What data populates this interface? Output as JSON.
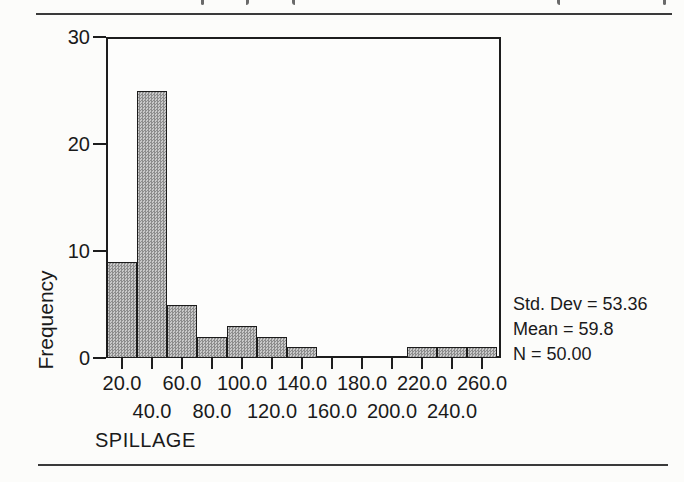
{
  "chart_data": {
    "type": "bar",
    "subtype": "histogram",
    "categories": [
      "20.0",
      "40.0",
      "60.0",
      "80.0",
      "100.0",
      "120.0",
      "140.0",
      "160.0",
      "180.0",
      "200.0",
      "220.0",
      "240.0",
      "260.0"
    ],
    "values": [
      9,
      25,
      5,
      2,
      3,
      2,
      1,
      0,
      0,
      0,
      1,
      1,
      1
    ],
    "bin_width": 20,
    "title": "",
    "xlabel": "SPILLAGE",
    "ylabel": "Frequency",
    "ylim": [
      0,
      30
    ],
    "yticks": [
      "0",
      "10",
      "20",
      "30"
    ],
    "grid": false,
    "legend_position": "none",
    "bar_fill_color": "#aaaaaa",
    "bar_border_color": "#1c1c1c",
    "annotations": [
      "Std. Dev = 53.36",
      "Mean = 59.8",
      "N = 50.00"
    ]
  }
}
